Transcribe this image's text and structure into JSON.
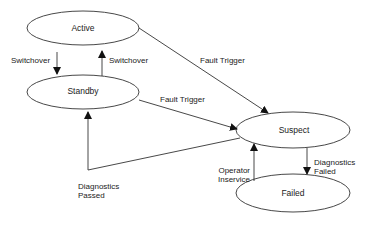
{
  "diagram": {
    "type": "state-diagram",
    "states": [
      {
        "id": "active",
        "label": "Active"
      },
      {
        "id": "standby",
        "label": "Standby"
      },
      {
        "id": "suspect",
        "label": "Suspect"
      },
      {
        "id": "failed",
        "label": "Failed"
      }
    ],
    "transitions": [
      {
        "from": "active",
        "to": "standby",
        "label": "Switchover"
      },
      {
        "from": "standby",
        "to": "active",
        "label": "Switchover"
      },
      {
        "from": "active",
        "to": "suspect",
        "label": "Fault Trigger"
      },
      {
        "from": "standby",
        "to": "suspect",
        "label": "Fault Trigger"
      },
      {
        "from": "suspect",
        "to": "standby",
        "label_line1": "Diagnostics",
        "label_line2": "Passed"
      },
      {
        "from": "suspect",
        "to": "failed",
        "label_line1": "Diagnostics",
        "label_line2": "Failed"
      },
      {
        "from": "failed",
        "to": "suspect",
        "label_line1": "Operator",
        "label_line2": "Inservice"
      }
    ]
  },
  "colors": {
    "stroke": "#222222",
    "background": "#ffffff"
  }
}
